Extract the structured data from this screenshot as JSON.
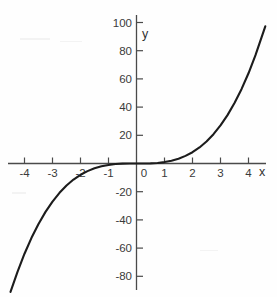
{
  "chart_data": {
    "type": "line",
    "title": "",
    "subtitle": "",
    "xlabel": "x",
    "ylabel": "y",
    "function": "y = x^3",
    "xlim": [
      -4.55,
      4.65
    ],
    "ylim": [
      -92,
      100
    ],
    "grid": false,
    "legend": null,
    "x_ticks": [
      -4,
      -3,
      -2,
      -1,
      0,
      1,
      2,
      3,
      4
    ],
    "x_tick_labels": [
      "-4",
      "-3",
      "-2",
      "-1",
      "0",
      "1",
      "2",
      "3",
      "4"
    ],
    "y_ticks": [
      -80,
      -60,
      -40,
      -20,
      20,
      40,
      60,
      80,
      100
    ],
    "y_tick_labels": [
      "-80",
      "-60",
      "-40",
      "-20",
      "20",
      "40",
      "60",
      "80",
      "100"
    ],
    "origin_label": "0",
    "series": [
      {
        "name": "y = x^3",
        "color": "#1c1c1c",
        "x": [
          -4.5,
          -4.25,
          -4,
          -3.75,
          -3.5,
          -3.25,
          -3,
          -2.75,
          -2.5,
          -2.25,
          -2,
          -1.75,
          -1.5,
          -1.25,
          -1,
          -0.75,
          -0.5,
          -0.25,
          0,
          0.25,
          0.5,
          0.75,
          1,
          1.25,
          1.5,
          1.75,
          2,
          2.25,
          2.5,
          2.75,
          3,
          3.25,
          3.5,
          3.75,
          4,
          4.25,
          4.6
        ],
        "values": [
          -91.1,
          -76.8,
          -64,
          -52.7,
          -42.9,
          -34.3,
          -27,
          -20.8,
          -15.6,
          -11.4,
          -8,
          -5.4,
          -3.4,
          -2,
          -1,
          -0.4,
          -0.1,
          0,
          0,
          0,
          0.1,
          0.4,
          1,
          2,
          3.4,
          5.4,
          8,
          11.4,
          15.6,
          20.8,
          27,
          34.3,
          42.9,
          52.7,
          64,
          76.8,
          97.3
        ]
      }
    ]
  },
  "axis_labels": {
    "x": "x",
    "y": "y"
  },
  "colors": {
    "curve": "#1c1c1c",
    "axis": "#4a4a4a",
    "text": "#3a3a3a",
    "background": "#fefefe"
  }
}
